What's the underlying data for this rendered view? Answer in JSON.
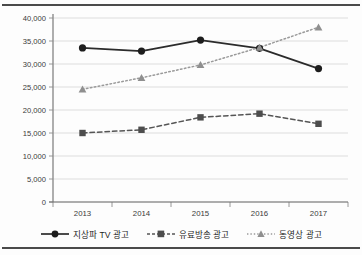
{
  "chart_data": {
    "type": "line",
    "title": "",
    "subtitle": "",
    "xlabel": "",
    "ylabel": "",
    "categories": [
      "2013",
      "2014",
      "2015",
      "2016",
      "2017"
    ],
    "x": [
      2013,
      2014,
      2015,
      2016,
      2017
    ],
    "ylim": [
      0,
      40000
    ],
    "ytick_values": [
      0,
      5000,
      10000,
      15000,
      20000,
      25000,
      30000,
      35000,
      40000
    ],
    "ytick_labels": [
      "0",
      "5,000",
      "10,000",
      "15,000",
      "20,000",
      "25,000",
      "30,000",
      "35,000",
      "40,000"
    ],
    "grid": true,
    "grid_axis": "y",
    "legend_position": "bottom",
    "series": [
      {
        "name": "지상파 TV 광고",
        "values": [
          33500,
          32800,
          35200,
          33400,
          29000
        ],
        "color": "#2b2b2b",
        "line_style": "solid",
        "marker": "circle"
      },
      {
        "name": "유료방송 광고",
        "values": [
          15000,
          15700,
          18400,
          19200,
          17000
        ],
        "color": "#555555",
        "line_style": "dashed",
        "marker": "square"
      },
      {
        "name": "동영상 광고",
        "values": [
          24500,
          27000,
          29800,
          33600,
          38000
        ],
        "color": "#9a9a9a",
        "line_style": "dotted",
        "marker": "triangle"
      }
    ]
  },
  "legend": {
    "items": [
      {
        "label": "지상파 TV 광고"
      },
      {
        "label": "유료방송 광고"
      },
      {
        "label": "동영상 광고"
      }
    ]
  },
  "axes": {
    "y_labels": [
      "40,000",
      "35,000",
      "30,000",
      "25,000",
      "20,000",
      "15,000",
      "10,000",
      "5,000",
      "0"
    ],
    "x_labels": [
      "2013",
      "2014",
      "2015",
      "2016",
      "2017"
    ]
  },
  "colors": {
    "series_1": "#2b2b2b",
    "series_2": "#555555",
    "series_3": "#9a9a9a",
    "grid": "#d9d9d9",
    "axis": "#8c8c8c",
    "rule": "#4a4a4a"
  }
}
